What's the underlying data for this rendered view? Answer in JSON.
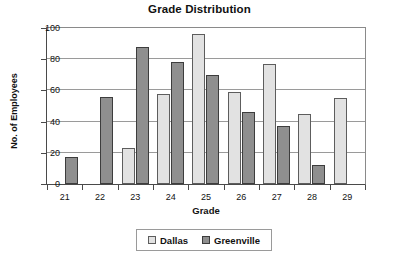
{
  "chart_data": {
    "type": "bar",
    "title": "Grade Distribution",
    "xlabel": "Grade",
    "ylabel": "No. of Employees",
    "categories": [
      "21",
      "22",
      "23",
      "24",
      "25",
      "26",
      "27",
      "28",
      "29"
    ],
    "series": [
      {
        "name": "Dallas",
        "color": "#e2e2e2",
        "values": [
          null,
          null,
          23,
          58,
          96,
          59,
          77,
          45,
          55
        ]
      },
      {
        "name": "Greenville",
        "color": "#8f8f8f",
        "values": [
          17,
          56,
          88,
          78,
          70,
          46,
          37,
          12,
          null
        ]
      }
    ],
    "ylim": [
      0,
      100
    ],
    "yticks": [
      0,
      20,
      40,
      60,
      80,
      100
    ],
    "grid": true,
    "legend_position": "bottom"
  },
  "legend": {
    "entries": [
      {
        "label": "Dallas"
      },
      {
        "label": "Greenville"
      }
    ]
  }
}
